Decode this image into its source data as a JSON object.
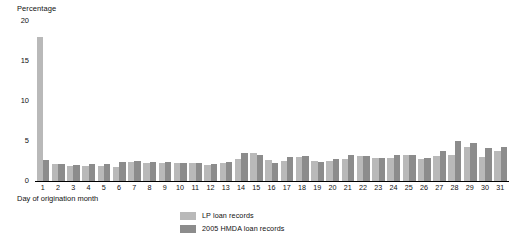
{
  "chart_data": {
    "type": "bar",
    "title": "",
    "ylabel": "Percentage",
    "xlabel": "Day of origination month",
    "ylim": [
      0,
      20
    ],
    "yticks": [
      0,
      5,
      10,
      15,
      20
    ],
    "grid": false,
    "legend_position": "bottom-center",
    "categories": [
      "1",
      "2",
      "3",
      "4",
      "5",
      "6",
      "7",
      "8",
      "9",
      "10",
      "11",
      "12",
      "13",
      "14",
      "15",
      "16",
      "17",
      "18",
      "19",
      "20",
      "21",
      "22",
      "23",
      "24",
      "25",
      "26",
      "27",
      "28",
      "29",
      "30",
      "31"
    ],
    "series": [
      {
        "name": "LP loan records",
        "color": "#b9b9b9",
        "values": [
          18.0,
          2.1,
          1.9,
          1.9,
          1.9,
          1.7,
          2.4,
          2.3,
          2.2,
          2.2,
          2.2,
          2.0,
          2.3,
          2.8,
          3.5,
          2.6,
          2.5,
          3.0,
          2.5,
          2.5,
          2.7,
          3.1,
          2.9,
          2.9,
          3.3,
          2.7,
          3.1,
          3.3,
          4.3,
          3.0,
          3.7
        ]
      },
      {
        "name": "2005 HMDA loan records",
        "color": "#8c8c8c",
        "values": [
          2.6,
          2.1,
          2.0,
          2.1,
          2.1,
          2.4,
          2.5,
          2.4,
          2.4,
          2.3,
          2.3,
          2.1,
          2.4,
          3.5,
          3.2,
          2.3,
          3.0,
          3.1,
          2.4,
          2.7,
          3.2,
          3.1,
          2.9,
          3.2,
          3.2,
          2.9,
          3.7,
          5.0,
          4.8,
          4.1,
          4.3
        ]
      }
    ]
  },
  "legend": {
    "items": [
      {
        "label": "LP loan records"
      },
      {
        "label": "2005 HMDA loan records"
      }
    ]
  }
}
